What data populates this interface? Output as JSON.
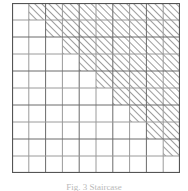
{
  "figure": {
    "label": "hatched-staircase-grid",
    "caption": "Fig. 3 Staircase",
    "colors": {
      "background": "#ffffff",
      "grid_line": "#6b6b6b",
      "grid_line_light": "#9a9a9a",
      "border": "#555555",
      "hatch_line": "#8c8c8c",
      "hatch_fill": "#ffffff",
      "caption_text": "#b9b9b9"
    }
  },
  "chart_data": {
    "type": "heatmap",
    "title": "",
    "subtitle": "",
    "xlabel": "",
    "ylabel": "",
    "rows": 10,
    "columns": 10,
    "grid": true,
    "legend": "none",
    "x": [
      1,
      2,
      3,
      4,
      5,
      6,
      7,
      8,
      9,
      10
    ],
    "y": [
      1,
      2,
      3,
      4,
      5,
      6,
      7,
      8,
      9,
      10
    ],
    "xlim": [
      0,
      10
    ],
    "ylim": [
      0,
      10
    ],
    "categories": [
      "row 1",
      "row 2",
      "row 3",
      "row 4",
      "row 5",
      "row 6",
      "row 7",
      "row 8",
      "row 9",
      "row 10"
    ],
    "series": [
      {
        "name": "hatched cell count per row",
        "values": [
          9,
          8,
          7,
          6,
          5,
          4,
          3,
          2,
          1,
          0
        ]
      },
      {
        "name": "first hatched column per row",
        "values": [
          2,
          3,
          4,
          5,
          6,
          7,
          8,
          9,
          10,
          0
        ]
      }
    ],
    "cells": [
      [
        0,
        1,
        1,
        1,
        1,
        1,
        1,
        1,
        1,
        1
      ],
      [
        0,
        0,
        1,
        1,
        1,
        1,
        1,
        1,
        1,
        1
      ],
      [
        0,
        0,
        0,
        1,
        1,
        1,
        1,
        1,
        1,
        1
      ],
      [
        0,
        0,
        0,
        0,
        1,
        1,
        1,
        1,
        1,
        1
      ],
      [
        0,
        0,
        0,
        0,
        0,
        1,
        1,
        1,
        1,
        1
      ],
      [
        0,
        0,
        0,
        0,
        0,
        0,
        1,
        1,
        1,
        1
      ],
      [
        0,
        0,
        0,
        0,
        0,
        0,
        0,
        1,
        1,
        1
      ],
      [
        0,
        0,
        0,
        0,
        0,
        0,
        0,
        0,
        1,
        1
      ],
      [
        0,
        0,
        0,
        0,
        0,
        0,
        0,
        0,
        0,
        1
      ],
      [
        0,
        0,
        0,
        0,
        0,
        0,
        0,
        0,
        0,
        0
      ]
    ],
    "cell_states": {
      "0": "plain",
      "1": "hatched"
    },
    "total_hatched": 45,
    "total_plain": 55,
    "annotations": []
  }
}
